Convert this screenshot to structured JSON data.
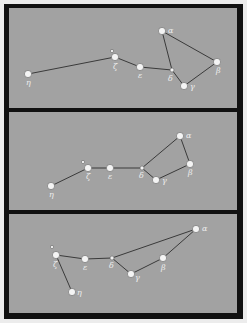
{
  "colors": {
    "background": "#ececec",
    "frame": "#111111",
    "panel": "#a2a2a2",
    "star": "#f4f4f4",
    "line": "#3a3a3a"
  },
  "panels": [
    {
      "name": "panel-1",
      "stars": [
        {
          "id": "alpha",
          "label": "α",
          "x": 162,
          "y": 31,
          "lx": 6,
          "ly": 2
        },
        {
          "id": "beta",
          "label": "β",
          "x": 217,
          "y": 62,
          "lx": -1,
          "ly": 11
        },
        {
          "id": "gamma",
          "label": "γ",
          "x": 184,
          "y": 86,
          "lx": 6,
          "ly": 3
        },
        {
          "id": "delta",
          "label": "δ",
          "x": 172,
          "y": 70,
          "lx": -4,
          "ly": 11,
          "small": true
        },
        {
          "id": "epsilon",
          "label": "ε",
          "x": 140,
          "y": 67,
          "lx": -2,
          "ly": 11
        },
        {
          "id": "zeta",
          "label": "ζ",
          "x": 115,
          "y": 57,
          "lx": -2,
          "ly": 12
        },
        {
          "id": "zeta-companion",
          "label": "",
          "x": 112,
          "y": 51,
          "tiny": true
        },
        {
          "id": "eta",
          "label": "η",
          "x": 28,
          "y": 74,
          "lx": -2,
          "ly": 11
        }
      ],
      "lines": [
        [
          "eta",
          "zeta"
        ],
        [
          "zeta",
          "epsilon"
        ],
        [
          "epsilon",
          "delta"
        ],
        [
          "delta",
          "alpha"
        ],
        [
          "alpha",
          "beta"
        ],
        [
          "beta",
          "gamma"
        ],
        [
          "gamma",
          "delta"
        ]
      ]
    },
    {
      "name": "panel-2",
      "stars": [
        {
          "id": "alpha",
          "label": "α",
          "x": 180,
          "y": 136,
          "lx": 6,
          "ly": 2
        },
        {
          "id": "beta",
          "label": "β",
          "x": 190,
          "y": 164,
          "lx": -2,
          "ly": 11
        },
        {
          "id": "gamma",
          "label": "γ",
          "x": 156,
          "y": 180,
          "lx": 6,
          "ly": 3
        },
        {
          "id": "delta",
          "label": "δ",
          "x": 142,
          "y": 168,
          "lx": -3,
          "ly": 10,
          "small": true
        },
        {
          "id": "epsilon",
          "label": "ε",
          "x": 110,
          "y": 168,
          "lx": -2,
          "ly": 11
        },
        {
          "id": "zeta",
          "label": "ζ",
          "x": 88,
          "y": 168,
          "lx": -2,
          "ly": 11
        },
        {
          "id": "zeta-companion",
          "label": "",
          "x": 83,
          "y": 162,
          "tiny": true
        },
        {
          "id": "eta",
          "label": "η",
          "x": 51,
          "y": 186,
          "lx": -2,
          "ly": 11
        }
      ],
      "lines": [
        [
          "eta",
          "zeta"
        ],
        [
          "zeta",
          "epsilon"
        ],
        [
          "epsilon",
          "delta"
        ],
        [
          "delta",
          "alpha"
        ],
        [
          "alpha",
          "beta"
        ],
        [
          "beta",
          "gamma"
        ],
        [
          "gamma",
          "delta"
        ]
      ]
    },
    {
      "name": "panel-3",
      "stars": [
        {
          "id": "alpha",
          "label": "α",
          "x": 196,
          "y": 229,
          "lx": 6,
          "ly": 2
        },
        {
          "id": "beta",
          "label": "β",
          "x": 163,
          "y": 258,
          "lx": -2,
          "ly": 12
        },
        {
          "id": "gamma",
          "label": "γ",
          "x": 131,
          "y": 274,
          "lx": 4,
          "ly": 6
        },
        {
          "id": "delta",
          "label": "δ",
          "x": 112,
          "y": 258,
          "lx": -3,
          "ly": 10,
          "small": true
        },
        {
          "id": "epsilon",
          "label": "ε",
          "x": 85,
          "y": 259,
          "lx": -2,
          "ly": 11
        },
        {
          "id": "zeta",
          "label": "ζ",
          "x": 56,
          "y": 255,
          "lx": -3,
          "ly": 12
        },
        {
          "id": "zeta-companion",
          "label": "",
          "x": 52,
          "y": 247,
          "tiny": true
        },
        {
          "id": "eta",
          "label": "η",
          "x": 72,
          "y": 292,
          "lx": 5,
          "ly": 3
        }
      ],
      "lines": [
        [
          "eta",
          "zeta"
        ],
        [
          "zeta",
          "epsilon"
        ],
        [
          "epsilon",
          "delta"
        ],
        [
          "delta",
          "alpha"
        ],
        [
          "alpha",
          "beta"
        ],
        [
          "beta",
          "gamma"
        ],
        [
          "gamma",
          "delta"
        ]
      ]
    }
  ]
}
